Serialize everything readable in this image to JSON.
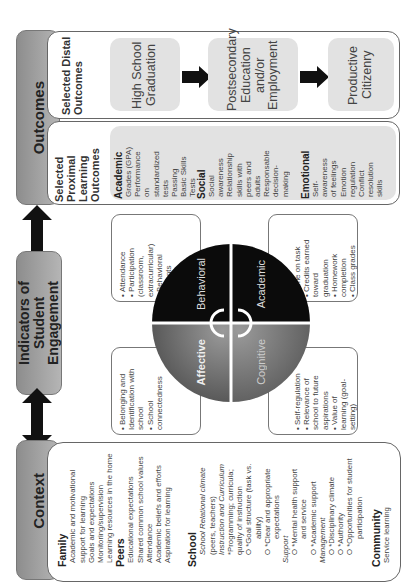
{
  "outcomes": {
    "header": "Outcomes",
    "distal": {
      "label": "Selected Distal Outcomes",
      "items": [
        "High School Graduation",
        "Postsecondary Education and/or Employment",
        "Productive Citizenry"
      ]
    },
    "proximal": {
      "label": "Selected Proximal Learning Outcomes",
      "groups": [
        {
          "title": "Academic",
          "items": [
            "Grades (GPA)",
            "Performance on standardized tests",
            "Passing Basic Skills Tests"
          ]
        },
        {
          "title": "Social",
          "items": [
            "Social awareness",
            "Relationship skills with peers and adults",
            "Responsable decision-making"
          ]
        },
        {
          "title": "Emotional",
          "items": [
            "Self-awareness of feelings",
            "Emotion regulation",
            "Conflict resolution skills"
          ]
        }
      ]
    }
  },
  "engagement": {
    "header": "Indicators of Student Engagement",
    "quadrants": {
      "behavioral": {
        "label": "Behavioral",
        "color": "#0a0a0a",
        "items": [
          "Attendance",
          "Participation (classroom, extracurricular)",
          "Behavioral incidents"
        ]
      },
      "academic": {
        "label": "Academic",
        "color": "#0a0a0a",
        "items": [
          "Time on task",
          "Credits earned toward graduation",
          "Homework completion",
          "Class grades"
        ]
      },
      "affective": {
        "label": "Affective",
        "color": "#6e6e6e",
        "items": [
          "Belonging and Identification with school",
          "School connectedness"
        ]
      },
      "cognitive": {
        "label": "Cognitive",
        "color": "#777777",
        "items": [
          "Self-regulation",
          "Relevance of school to future aspirations",
          "Value of learning (goal-setting)"
        ]
      }
    }
  },
  "context": {
    "header": "Context",
    "family": {
      "title": "Family",
      "items": [
        "Academic and motivational support for learning",
        "Goals and expectations",
        "Monitoring/supervision",
        "Learning resources in the home"
      ]
    },
    "peers": {
      "title": "Peers",
      "items": [
        "Educational expectations",
        "Shared common school values",
        "Attendance",
        "Academic beliefs and efforts",
        "Aspiration for learning"
      ]
    },
    "school": {
      "title": "School",
      "lines": [
        "School Relational climate",
        "(peers, teachers)",
        "Instruction and Curriculum",
        "*Programming; curricula;",
        "quality of instruction",
        "O *Goal structure (task vs.",
        "ability)",
        "O *Clear and appropriate",
        "expectations",
        "Support",
        "O *Mental health support",
        "and service",
        "O *Academic support",
        "Management",
        "O *Disciplinary climate",
        "O *Authority",
        "O *Opportunities for student",
        "participation"
      ]
    },
    "community": {
      "title": "Community",
      "items": [
        "Service learning"
      ]
    }
  }
}
